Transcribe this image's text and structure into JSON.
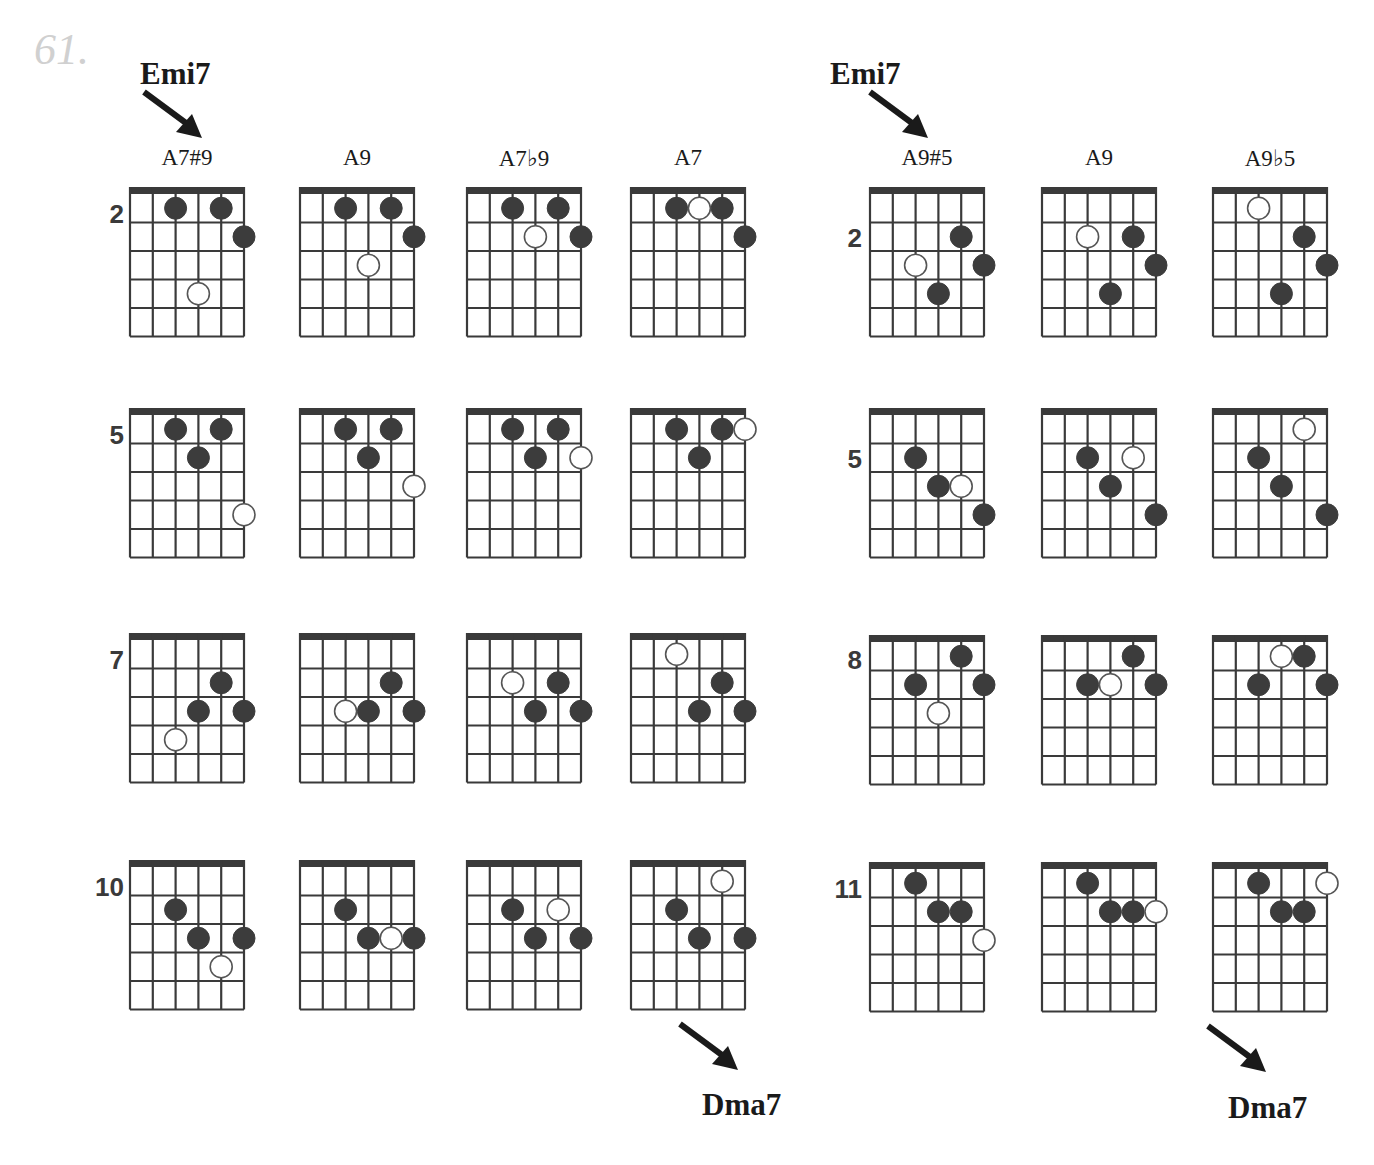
{
  "exercise_number": "61.",
  "sections": [
    {
      "start_chord": "Emi7",
      "end_chord": "Dma7",
      "columns": [
        "A7#9",
        "A9",
        "A7♭9",
        "A7"
      ],
      "rows": [
        {
          "fret": "2",
          "diagrams": [
            {
              "dots": [
                [
                  3,
                  1,
                  true
                ],
                [
                  5,
                  1,
                  true
                ],
                [
                  6,
                  2,
                  true
                ],
                [
                  4,
                  4,
                  false
                ]
              ]
            },
            {
              "dots": [
                [
                  3,
                  1,
                  true
                ],
                [
                  5,
                  1,
                  true
                ],
                [
                  6,
                  2,
                  true
                ],
                [
                  4,
                  3,
                  false
                ]
              ]
            },
            {
              "dots": [
                [
                  3,
                  1,
                  true
                ],
                [
                  5,
                  1,
                  true
                ],
                [
                  6,
                  2,
                  true
                ],
                [
                  4,
                  2,
                  false
                ]
              ]
            },
            {
              "dots": [
                [
                  3,
                  1,
                  true
                ],
                [
                  4,
                  1,
                  false
                ],
                [
                  5,
                  1,
                  true
                ],
                [
                  6,
                  2,
                  true
                ]
              ]
            }
          ]
        },
        {
          "fret": "5",
          "diagrams": [
            {
              "dots": [
                [
                  3,
                  1,
                  true
                ],
                [
                  5,
                  1,
                  true
                ],
                [
                  4,
                  2,
                  true
                ],
                [
                  6,
                  4,
                  false
                ]
              ]
            },
            {
              "dots": [
                [
                  3,
                  1,
                  true
                ],
                [
                  5,
                  1,
                  true
                ],
                [
                  4,
                  2,
                  true
                ],
                [
                  6,
                  3,
                  false
                ]
              ]
            },
            {
              "dots": [
                [
                  3,
                  1,
                  true
                ],
                [
                  5,
                  1,
                  true
                ],
                [
                  4,
                  2,
                  true
                ],
                [
                  6,
                  2,
                  false
                ]
              ]
            },
            {
              "dots": [
                [
                  3,
                  1,
                  true
                ],
                [
                  5,
                  1,
                  true
                ],
                [
                  4,
                  2,
                  true
                ],
                [
                  6,
                  1,
                  false
                ]
              ]
            }
          ]
        },
        {
          "fret": "7",
          "diagrams": [
            {
              "dots": [
                [
                  5,
                  2,
                  true
                ],
                [
                  4,
                  3,
                  true
                ],
                [
                  6,
                  3,
                  true
                ],
                [
                  3,
                  4,
                  false
                ]
              ]
            },
            {
              "dots": [
                [
                  5,
                  2,
                  true
                ],
                [
                  4,
                  3,
                  true
                ],
                [
                  6,
                  3,
                  true
                ],
                [
                  3,
                  3,
                  false
                ]
              ]
            },
            {
              "dots": [
                [
                  5,
                  2,
                  true
                ],
                [
                  4,
                  3,
                  true
                ],
                [
                  6,
                  3,
                  true
                ],
                [
                  3,
                  2,
                  false
                ]
              ]
            },
            {
              "dots": [
                [
                  5,
                  2,
                  true
                ],
                [
                  4,
                  3,
                  true
                ],
                [
                  6,
                  3,
                  true
                ],
                [
                  3,
                  1,
                  false
                ]
              ]
            }
          ]
        },
        {
          "fret": "10",
          "diagrams": [
            {
              "dots": [
                [
                  3,
                  2,
                  true
                ],
                [
                  4,
                  3,
                  true
                ],
                [
                  6,
                  3,
                  true
                ],
                [
                  5,
                  4,
                  false
                ]
              ]
            },
            {
              "dots": [
                [
                  3,
                  2,
                  true
                ],
                [
                  4,
                  3,
                  true
                ],
                [
                  6,
                  3,
                  true
                ],
                [
                  5,
                  3,
                  false
                ]
              ]
            },
            {
              "dots": [
                [
                  3,
                  2,
                  true
                ],
                [
                  4,
                  3,
                  true
                ],
                [
                  6,
                  3,
                  true
                ],
                [
                  5,
                  2,
                  false
                ]
              ]
            },
            {
              "dots": [
                [
                  3,
                  2,
                  true
                ],
                [
                  4,
                  3,
                  true
                ],
                [
                  6,
                  3,
                  true
                ],
                [
                  5,
                  1,
                  false
                ]
              ]
            }
          ]
        }
      ]
    },
    {
      "start_chord": "Emi7",
      "end_chord": "Dma7",
      "columns": [
        "A9#5",
        "A9",
        "A9♭5"
      ],
      "rows": [
        {
          "fret": "2",
          "diagrams": [
            {
              "dots": [
                [
                  5,
                  2,
                  true
                ],
                [
                  6,
                  3,
                  true
                ],
                [
                  3,
                  3,
                  false
                ],
                [
                  4,
                  4,
                  true
                ]
              ]
            },
            {
              "dots": [
                [
                  3,
                  2,
                  false
                ],
                [
                  5,
                  2,
                  true
                ],
                [
                  6,
                  3,
                  true
                ],
                [
                  4,
                  4,
                  true
                ]
              ]
            },
            {
              "dots": [
                [
                  3,
                  1,
                  false
                ],
                [
                  5,
                  2,
                  true
                ],
                [
                  6,
                  3,
                  true
                ],
                [
                  4,
                  4,
                  true
                ]
              ]
            }
          ]
        },
        {
          "fret": "5",
          "diagrams": [
            {
              "dots": [
                [
                  3,
                  2,
                  true
                ],
                [
                  4,
                  3,
                  true
                ],
                [
                  5,
                  3,
                  false
                ],
                [
                  6,
                  4,
                  true
                ]
              ]
            },
            {
              "dots": [
                [
                  3,
                  2,
                  true
                ],
                [
                  5,
                  2,
                  false
                ],
                [
                  4,
                  3,
                  true
                ],
                [
                  6,
                  4,
                  true
                ]
              ]
            },
            {
              "dots": [
                [
                  5,
                  1,
                  false
                ],
                [
                  3,
                  2,
                  true
                ],
                [
                  4,
                  3,
                  true
                ],
                [
                  6,
                  4,
                  true
                ]
              ]
            }
          ]
        },
        {
          "fret": "8",
          "diagrams": [
            {
              "dots": [
                [
                  5,
                  1,
                  true
                ],
                [
                  3,
                  2,
                  true
                ],
                [
                  6,
                  2,
                  true
                ],
                [
                  4,
                  3,
                  false
                ]
              ]
            },
            {
              "dots": [
                [
                  5,
                  1,
                  true
                ],
                [
                  3,
                  2,
                  true
                ],
                [
                  4,
                  2,
                  false
                ],
                [
                  6,
                  2,
                  true
                ]
              ]
            },
            {
              "dots": [
                [
                  4,
                  1,
                  false
                ],
                [
                  5,
                  1,
                  true
                ],
                [
                  3,
                  2,
                  true
                ],
                [
                  6,
                  2,
                  true
                ]
              ]
            }
          ]
        },
        {
          "fret": "11",
          "diagrams": [
            {
              "dots": [
                [
                  3,
                  1,
                  true
                ],
                [
                  4,
                  2,
                  true
                ],
                [
                  5,
                  2,
                  true
                ],
                [
                  6,
                  3,
                  false
                ]
              ]
            },
            {
              "dots": [
                [
                  3,
                  1,
                  true
                ],
                [
                  4,
                  2,
                  true
                ],
                [
                  5,
                  2,
                  true
                ],
                [
                  6,
                  2,
                  false
                ]
              ]
            },
            {
              "dots": [
                [
                  3,
                  1,
                  true
                ],
                [
                  4,
                  2,
                  true
                ],
                [
                  5,
                  2,
                  true
                ],
                [
                  6,
                  1,
                  false
                ]
              ]
            }
          ]
        }
      ]
    }
  ],
  "colors": {
    "ink": "#3a3a3a",
    "dot_fill": "#3c3c3c",
    "open_dot_fill": "#ffffff",
    "exercise_number": "#d0d0d0"
  }
}
